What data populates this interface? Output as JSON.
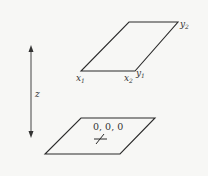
{
  "diagram": {
    "axis": {
      "label": "z",
      "direction": "vertical double-headed arrow"
    },
    "top_plane": {
      "labels": {
        "x1": "x",
        "x1_sub": "1",
        "x2": "x",
        "x2_sub": "2",
        "y1": "y",
        "y1_sub": "1",
        "y2": "y",
        "y2_sub": "2"
      }
    },
    "bottom_plane": {
      "origin_label": "0, 0, 0",
      "marker": "cross"
    },
    "colors": {
      "line": "#2a2a2a",
      "background": "#f7f7f5",
      "text": "#333333"
    }
  }
}
